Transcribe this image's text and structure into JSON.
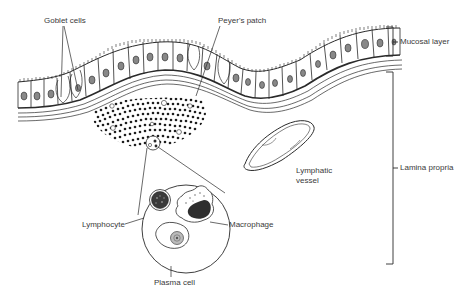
{
  "diagram": {
    "type": "anatomical-illustration",
    "labels": {
      "goblet_cells": "Goblet cells",
      "peyers_patch": "Peyer's patch",
      "mucosal_layer": "Mucosal layer",
      "lamina_propria": "Lamina propria",
      "lymphatic_vessel_line1": "Lymphatic",
      "lymphatic_vessel_line2": "vessel",
      "lymphocyte": "Lymphocyte",
      "macrophage": "Macrophage",
      "plasma_cell": "Plasma cell"
    },
    "colors": {
      "ink": "#2a2a2a",
      "text": "#3a3a3a",
      "background": "#ffffff"
    }
  }
}
